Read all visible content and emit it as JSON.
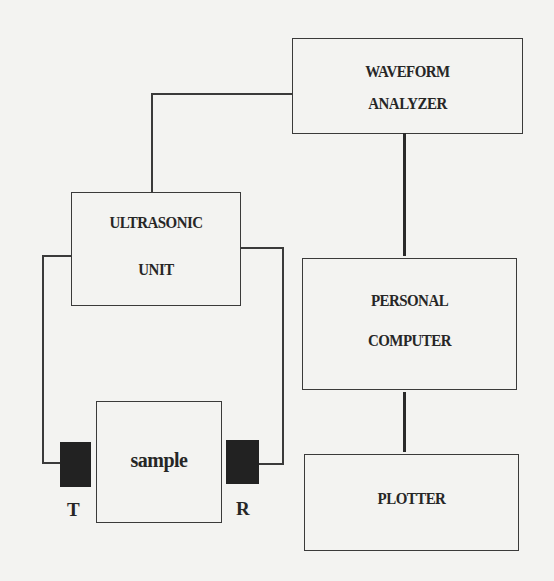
{
  "diagram": {
    "type": "block-diagram",
    "blocks": {
      "waveform_analyzer": {
        "line1": "WAVEFORM",
        "line2": "ANALYZER"
      },
      "ultrasonic_unit": {
        "line1": "ULTRASONIC",
        "line2": "UNIT"
      },
      "personal_computer": {
        "line1": "PERSONAL",
        "line2": "COMPUTER"
      },
      "plotter": {
        "line1": "PLOTTER"
      },
      "sample": {
        "line1": "sample"
      }
    },
    "transducers": {
      "transmitter": "T",
      "receiver": "R"
    },
    "connections": [
      {
        "from": "ultrasonic_unit",
        "to": "waveform_analyzer"
      },
      {
        "from": "waveform_analyzer",
        "to": "personal_computer"
      },
      {
        "from": "personal_computer",
        "to": "plotter"
      },
      {
        "from": "ultrasonic_unit",
        "to": "transmitter"
      },
      {
        "from": "ultrasonic_unit",
        "to": "receiver"
      }
    ],
    "colors": {
      "line": "#3a3a3a",
      "transducer_fill": "#222222",
      "background": "#f3f3f1"
    }
  }
}
